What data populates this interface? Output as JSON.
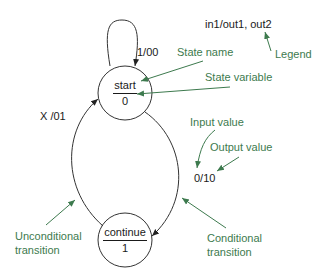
{
  "diagram": {
    "type": "state-machine",
    "colors": {
      "line": "#333333",
      "annotation": "#3d7a4e"
    },
    "states": [
      {
        "id": "start",
        "name": "start",
        "variable": "0"
      },
      {
        "id": "continue",
        "name": "continue",
        "variable": "1"
      }
    ],
    "transitions": [
      {
        "from": "start",
        "to": "start",
        "label": "1/00"
      },
      {
        "from": "start",
        "to": "continue",
        "label": "0/10"
      },
      {
        "from": "continue",
        "to": "start",
        "label": "X /01"
      }
    ],
    "legend": {
      "format": "in1/out1, out2",
      "label": "Legend"
    },
    "annotations": {
      "state_name": "State name",
      "state_variable": "State variable",
      "input_value": "Input value",
      "output_value": "Output value",
      "unconditional_line1": "Unconditional",
      "unconditional_line2": "transition",
      "conditional_line1": "Conditional",
      "conditional_line2": "transition"
    }
  }
}
